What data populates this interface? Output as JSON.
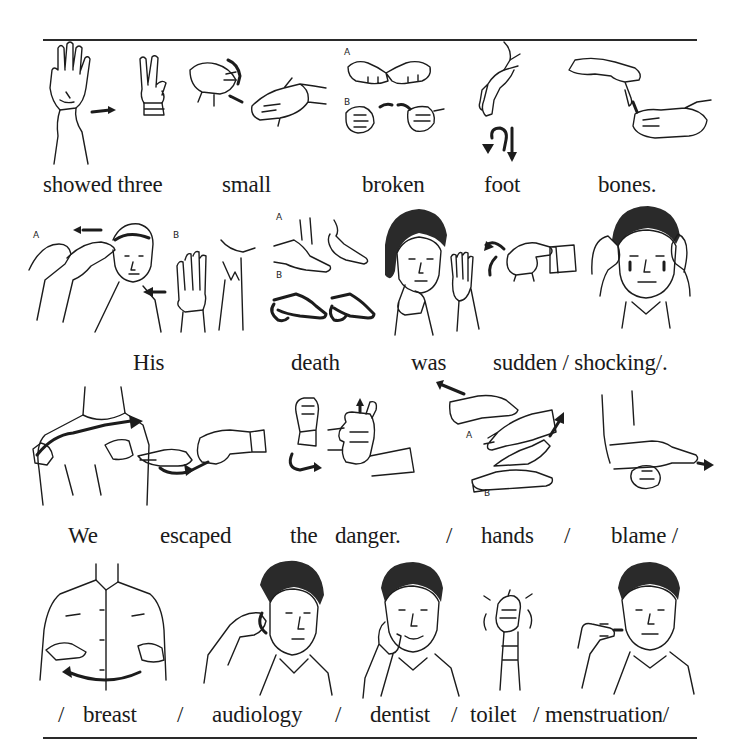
{
  "page": {
    "rows": [
      {
        "id": "row1",
        "words": [
          "showed three",
          "small",
          "broken",
          "foot",
          "bones."
        ],
        "illustrations": [
          {
            "name": "showed-sign",
            "labels": []
          },
          {
            "name": "three-sign",
            "labels": []
          },
          {
            "name": "small-sign",
            "labels": []
          },
          {
            "name": "broken-sign",
            "labels": [
              "A",
              "B"
            ]
          },
          {
            "name": "foot-sign",
            "labels": []
          },
          {
            "name": "bones-sign",
            "labels": []
          }
        ]
      },
      {
        "id": "row2",
        "words": [
          "His",
          "death",
          "was",
          "sudden / shocking/."
        ],
        "illustrations": [
          {
            "name": "his-sign",
            "labels": [
              "A",
              "B"
            ]
          },
          {
            "name": "death-sign",
            "labels": [
              "A",
              "B"
            ]
          },
          {
            "name": "was-sign",
            "labels": []
          },
          {
            "name": "sudden-sign",
            "labels": []
          },
          {
            "name": "shocking-sign",
            "labels": []
          }
        ]
      },
      {
        "id": "row3",
        "words": [
          "We",
          "escaped",
          "the",
          "danger.",
          "/",
          "hands",
          "/",
          "blame /"
        ],
        "illustrations": [
          {
            "name": "we-sign",
            "labels": []
          },
          {
            "name": "escaped-sign",
            "labels": []
          },
          {
            "name": "danger-sign",
            "labels": []
          },
          {
            "name": "hands-sign",
            "labels": [
              "A",
              "B"
            ]
          },
          {
            "name": "blame-sign",
            "labels": []
          }
        ]
      },
      {
        "id": "row4",
        "words": [
          "/",
          "breast",
          "/",
          "audiology",
          "/",
          "dentist",
          "/",
          "toilet",
          "/",
          "menstruation/"
        ],
        "illustrations": [
          {
            "name": "breast-sign",
            "labels": []
          },
          {
            "name": "audiology-sign",
            "labels": []
          },
          {
            "name": "dentist-sign",
            "labels": []
          },
          {
            "name": "toilet-sign",
            "labels": []
          },
          {
            "name": "menstruation-sign",
            "labels": []
          }
        ]
      }
    ],
    "labels": {
      "a": "A",
      "b": "B"
    }
  }
}
